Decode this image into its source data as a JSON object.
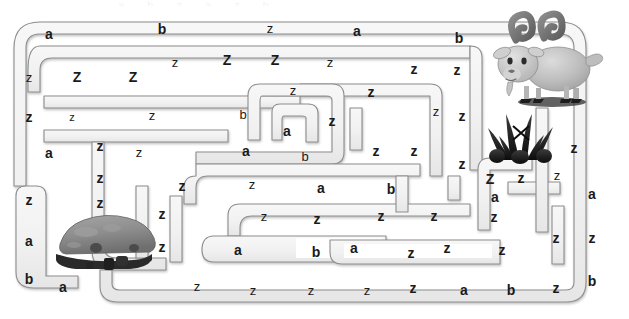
{
  "page": {
    "width": 629,
    "height": 319,
    "background_color": "#ffffff",
    "top_partial_text": "a b z a z b"
  },
  "maze": {
    "path_fill_color": "#f2f2f2",
    "path_stroke_color": "#8a8a8a",
    "shadow_color": "#c9c9c9",
    "letter_color": "#1a1a1a",
    "description": "Rounded-corridor maze filled with repeated letters a, b, z and Z"
  },
  "art": {
    "goat": {
      "name": "goat",
      "label": "goat-illustration",
      "body_color": "#b9b9b9",
      "horn_color": "#6e6e6e",
      "position": "top-right"
    },
    "grass": {
      "name": "grass",
      "label": "grass-tuft-illustration",
      "color": "#161616",
      "position": "right-upper-middle"
    },
    "rock": {
      "name": "rock",
      "label": "rock-illustration",
      "color": "#8b8b8b",
      "shadow_color": "#2b2b2b",
      "position": "bottom-left"
    }
  },
  "letters": [
    {
      "ch": "a",
      "x": 49,
      "y": 34,
      "size": "sz-lg"
    },
    {
      "ch": "b",
      "x": 162,
      "y": 29,
      "size": "sz-lg"
    },
    {
      "ch": "z",
      "x": 270,
      "y": 28,
      "size": "sz-md"
    },
    {
      "ch": "a",
      "x": 357,
      "y": 31,
      "size": "sz-lg"
    },
    {
      "ch": "b",
      "x": 459,
      "y": 38,
      "size": "sz-lg"
    },
    {
      "ch": "z",
      "x": 29,
      "y": 77,
      "size": "sz-md"
    },
    {
      "ch": "Z",
      "x": 77,
      "y": 77,
      "size": "sz-lg"
    },
    {
      "ch": "Z",
      "x": 133,
      "y": 77,
      "size": "sz-lg"
    },
    {
      "ch": "z",
      "x": 175,
      "y": 62,
      "size": "sz-md"
    },
    {
      "ch": "Z",
      "x": 227,
      "y": 60,
      "size": "sz-lg"
    },
    {
      "ch": "Z",
      "x": 275,
      "y": 60,
      "size": "sz-lg"
    },
    {
      "ch": "z",
      "x": 330,
      "y": 62,
      "size": "sz-md"
    },
    {
      "ch": "z",
      "x": 414,
      "y": 69,
      "size": "sz-lg"
    },
    {
      "ch": "z",
      "x": 457,
      "y": 70,
      "size": "sz-lg"
    },
    {
      "ch": "z",
      "x": 293,
      "y": 90,
      "size": "sz-md"
    },
    {
      "ch": "z",
      "x": 29,
      "y": 117,
      "size": "sz-lg"
    },
    {
      "ch": "z",
      "x": 72,
      "y": 117,
      "size": "sz-sm"
    },
    {
      "ch": "z",
      "x": 152,
      "y": 115,
      "size": "sz-md"
    },
    {
      "ch": "b",
      "x": 243,
      "y": 114,
      "size": "sz-md"
    },
    {
      "ch": "a",
      "x": 287,
      "y": 131,
      "size": "sz-lg"
    },
    {
      "ch": "z",
      "x": 332,
      "y": 121,
      "size": "sz-lg"
    },
    {
      "ch": "z",
      "x": 371,
      "y": 92,
      "size": "sz-lg"
    },
    {
      "ch": "z",
      "x": 436,
      "y": 111,
      "size": "sz-md"
    },
    {
      "ch": "z",
      "x": 462,
      "y": 116,
      "size": "sz-lg"
    },
    {
      "ch": "a",
      "x": 49,
      "y": 153,
      "size": "sz-lg"
    },
    {
      "ch": "z",
      "x": 100,
      "y": 146,
      "size": "sz-lg"
    },
    {
      "ch": "z",
      "x": 139,
      "y": 152,
      "size": "sz-md"
    },
    {
      "ch": "a",
      "x": 246,
      "y": 151,
      "size": "sz-lg"
    },
    {
      "ch": "b",
      "x": 305,
      "y": 156,
      "size": "sz-md"
    },
    {
      "ch": "z",
      "x": 376,
      "y": 151,
      "size": "sz-lg"
    },
    {
      "ch": "z",
      "x": 414,
      "y": 151,
      "size": "sz-lg"
    },
    {
      "ch": "z",
      "x": 462,
      "y": 164,
      "size": "sz-lg"
    },
    {
      "ch": "z",
      "x": 574,
      "y": 148,
      "size": "sz-lg"
    },
    {
      "ch": "z",
      "x": 100,
      "y": 178,
      "size": "sz-lg"
    },
    {
      "ch": "z",
      "x": 182,
      "y": 186,
      "size": "sz-lg"
    },
    {
      "ch": "z",
      "x": 252,
      "y": 184,
      "size": "sz-md"
    },
    {
      "ch": "a",
      "x": 321,
      "y": 188,
      "size": "sz-lg"
    },
    {
      "ch": "b",
      "x": 391,
      "y": 189,
      "size": "sz-lg"
    },
    {
      "ch": "Z",
      "x": 490,
      "y": 179,
      "size": "sz-lg"
    },
    {
      "ch": "z",
      "x": 521,
      "y": 178,
      "size": "sz-lg"
    },
    {
      "ch": "z",
      "x": 557,
      "y": 175,
      "size": "sz-md"
    },
    {
      "ch": "z",
      "x": 29,
      "y": 200,
      "size": "sz-lg"
    },
    {
      "ch": "z",
      "x": 100,
      "y": 203,
      "size": "sz-lg"
    },
    {
      "ch": "z",
      "x": 162,
      "y": 214,
      "size": "sz-lg"
    },
    {
      "ch": "z",
      "x": 264,
      "y": 216,
      "size": "sz-md"
    },
    {
      "ch": "z",
      "x": 317,
      "y": 219,
      "size": "sz-lg"
    },
    {
      "ch": "z",
      "x": 381,
      "y": 216,
      "size": "sz-lg"
    },
    {
      "ch": "z",
      "x": 434,
      "y": 216,
      "size": "sz-lg"
    },
    {
      "ch": "a",
      "x": 495,
      "y": 197,
      "size": "sz-lg"
    },
    {
      "ch": "z",
      "x": 494,
      "y": 217,
      "size": "sz-lg"
    },
    {
      "ch": "a",
      "x": 592,
      "y": 194,
      "size": "sz-lg"
    },
    {
      "ch": "a",
      "x": 29,
      "y": 241,
      "size": "sz-lg"
    },
    {
      "ch": "z",
      "x": 162,
      "y": 247,
      "size": "sz-lg"
    },
    {
      "ch": "a",
      "x": 238,
      "y": 250,
      "size": "sz-lg"
    },
    {
      "ch": "b",
      "x": 316,
      "y": 252,
      "size": "sz-lg"
    },
    {
      "ch": "a",
      "x": 354,
      "y": 248,
      "size": "sz-lg"
    },
    {
      "ch": "z",
      "x": 411,
      "y": 253,
      "size": "sz-lg"
    },
    {
      "ch": "z",
      "x": 447,
      "y": 248,
      "size": "sz-lg"
    },
    {
      "ch": "z",
      "x": 502,
      "y": 250,
      "size": "sz-lg"
    },
    {
      "ch": "z",
      "x": 556,
      "y": 238,
      "size": "sz-lg"
    },
    {
      "ch": "z",
      "x": 592,
      "y": 238,
      "size": "sz-lg"
    },
    {
      "ch": "b",
      "x": 29,
      "y": 279,
      "size": "sz-lg"
    },
    {
      "ch": "a",
      "x": 63,
      "y": 287,
      "size": "sz-lg"
    },
    {
      "ch": "z",
      "x": 197,
      "y": 286,
      "size": "sz-md"
    },
    {
      "ch": "z",
      "x": 253,
      "y": 290,
      "size": "sz-md"
    },
    {
      "ch": "z",
      "x": 311,
      "y": 290,
      "size": "sz-md"
    },
    {
      "ch": "z",
      "x": 367,
      "y": 290,
      "size": "sz-md"
    },
    {
      "ch": "z",
      "x": 413,
      "y": 288,
      "size": "sz-lg"
    },
    {
      "ch": "a",
      "x": 464,
      "y": 290,
      "size": "sz-lg"
    },
    {
      "ch": "b",
      "x": 511,
      "y": 290,
      "size": "sz-lg"
    },
    {
      "ch": "z",
      "x": 556,
      "y": 288,
      "size": "sz-lg"
    },
    {
      "ch": "b",
      "x": 592,
      "y": 281,
      "size": "sz-lg"
    }
  ]
}
